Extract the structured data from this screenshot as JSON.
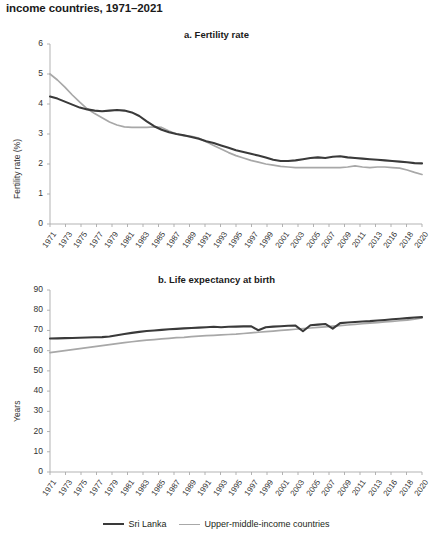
{
  "figure": {
    "title": "income countries, 1971–2021",
    "legend": [
      {
        "label": "Sri Lanka",
        "color": "#3a3a3a",
        "width": 2.2
      },
      {
        "label": "Upper-middle-income countries",
        "color": "#a8a8a8",
        "width": 1.8
      }
    ]
  },
  "chart_data": [
    {
      "type": "line",
      "title": "a. Fertility rate",
      "xlabel": "",
      "ylabel": "Fertility rate (%)",
      "ylim": [
        0,
        6
      ],
      "yticks": [
        0,
        1,
        2,
        3,
        4,
        5,
        6
      ],
      "xlim": [
        1971,
        2021
      ],
      "xticklabels": [
        "1971",
        "1973",
        "1975",
        "1977",
        "1979",
        "1981",
        "1983",
        "1985",
        "1987",
        "1989",
        "1991",
        "1993",
        "1995",
        "1997",
        "1999",
        "2001",
        "2003",
        "2005",
        "2007",
        "2009",
        "2011",
        "2013",
        "2016",
        "2018",
        "2020"
      ],
      "grid": false,
      "legend_position": "bottom",
      "x": [
        1971,
        1972,
        1973,
        1974,
        1975,
        1976,
        1977,
        1978,
        1979,
        1980,
        1981,
        1982,
        1983,
        1984,
        1985,
        1986,
        1987,
        1988,
        1989,
        1990,
        1991,
        1992,
        1993,
        1994,
        1995,
        1996,
        1997,
        1998,
        1999,
        2000,
        2001,
        2002,
        2003,
        2004,
        2005,
        2006,
        2007,
        2008,
        2009,
        2010,
        2011,
        2012,
        2013,
        2014,
        2015,
        2016,
        2017,
        2018,
        2019,
        2020,
        2021
      ],
      "series": [
        {
          "name": "Sri Lanka",
          "color": "#3a3a3a",
          "values": [
            4.25,
            4.18,
            4.08,
            3.98,
            3.88,
            3.82,
            3.78,
            3.76,
            3.78,
            3.8,
            3.78,
            3.72,
            3.6,
            3.42,
            3.26,
            3.14,
            3.06,
            3.0,
            2.96,
            2.9,
            2.84,
            2.76,
            2.7,
            2.62,
            2.54,
            2.46,
            2.4,
            2.34,
            2.28,
            2.22,
            2.14,
            2.1,
            2.1,
            2.12,
            2.16,
            2.2,
            2.22,
            2.2,
            2.24,
            2.26,
            2.22,
            2.2,
            2.18,
            2.16,
            2.14,
            2.12,
            2.1,
            2.08,
            2.06,
            2.03,
            2.02
          ]
        },
        {
          "name": "Upper-middle-income countries",
          "color": "#a8a8a8",
          "values": [
            5.0,
            4.8,
            4.56,
            4.3,
            4.06,
            3.84,
            3.68,
            3.54,
            3.4,
            3.3,
            3.24,
            3.22,
            3.22,
            3.22,
            3.24,
            3.22,
            3.1,
            3.0,
            2.94,
            2.92,
            2.86,
            2.74,
            2.62,
            2.5,
            2.38,
            2.28,
            2.2,
            2.12,
            2.06,
            2.0,
            1.96,
            1.92,
            1.9,
            1.88,
            1.88,
            1.88,
            1.88,
            1.88,
            1.88,
            1.88,
            1.9,
            1.94,
            1.9,
            1.88,
            1.9,
            1.9,
            1.88,
            1.86,
            1.8,
            1.72,
            1.65
          ]
        }
      ]
    },
    {
      "type": "line",
      "title": "b. Life expectancy at birth",
      "xlabel": "",
      "ylabel": "Years",
      "ylim": [
        0,
        90
      ],
      "yticks": [
        0,
        10,
        20,
        30,
        40,
        50,
        60,
        70,
        80,
        90
      ],
      "xlim": [
        1971,
        2021
      ],
      "xticklabels": [
        "1971",
        "1973",
        "1975",
        "1977",
        "1979",
        "1981",
        "1983",
        "1985",
        "1987",
        "1989",
        "1991",
        "1993",
        "1995",
        "1997",
        "1999",
        "2001",
        "2003",
        "2005",
        "2007",
        "2009",
        "2011",
        "2013",
        "2016",
        "2018",
        "2020"
      ],
      "grid": false,
      "legend_position": "bottom",
      "x": [
        1971,
        1972,
        1973,
        1974,
        1975,
        1976,
        1977,
        1978,
        1979,
        1980,
        1981,
        1982,
        1983,
        1984,
        1985,
        1986,
        1987,
        1988,
        1989,
        1990,
        1991,
        1992,
        1993,
        1994,
        1995,
        1996,
        1997,
        1998,
        1999,
        2000,
        2001,
        2002,
        2003,
        2004,
        2005,
        2006,
        2007,
        2008,
        2009,
        2010,
        2011,
        2012,
        2013,
        2014,
        2015,
        2016,
        2017,
        2018,
        2019,
        2020,
        2021
      ],
      "series": [
        {
          "name": "Sri Lanka",
          "color": "#3a3a3a",
          "values": [
            66.0,
            66.1,
            66.2,
            66.3,
            66.4,
            66.5,
            66.6,
            66.7,
            67.0,
            67.6,
            68.2,
            68.8,
            69.3,
            69.7,
            70.0,
            70.3,
            70.6,
            70.8,
            71.0,
            71.2,
            71.4,
            71.6,
            71.8,
            71.6,
            71.8,
            71.9,
            72.0,
            72.1,
            70.1,
            71.6,
            71.9,
            72.1,
            72.3,
            72.4,
            69.6,
            72.6,
            72.9,
            73.2,
            70.9,
            73.6,
            73.9,
            74.2,
            74.4,
            74.6,
            74.9,
            75.2,
            75.5,
            75.8,
            76.1,
            76.4,
            76.6
          ]
        },
        {
          "name": "Upper-middle-income countries",
          "color": "#a8a8a8",
          "values": [
            59.0,
            59.5,
            60.0,
            60.5,
            61.0,
            61.5,
            62.0,
            62.5,
            63.0,
            63.5,
            64.0,
            64.4,
            64.8,
            65.2,
            65.5,
            65.8,
            66.1,
            66.4,
            66.6,
            66.9,
            67.2,
            67.4,
            67.6,
            67.8,
            68.0,
            68.2,
            68.5,
            68.8,
            69.1,
            69.4,
            69.7,
            70.0,
            70.3,
            70.6,
            70.9,
            71.2,
            71.5,
            71.8,
            72.1,
            72.4,
            72.7,
            73.0,
            73.3,
            73.6,
            73.9,
            74.2,
            74.5,
            74.8,
            75.1,
            75.6,
            76.2
          ]
        }
      ]
    }
  ]
}
